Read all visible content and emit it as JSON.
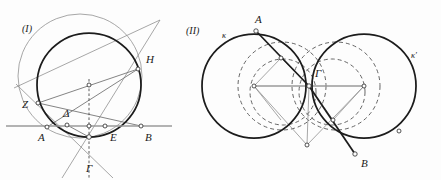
{
  "figure": {
    "background_color": "#fdfdfd",
    "ink_color": "#1c1c1c",
    "width": 441,
    "height": 180
  },
  "panels": [
    {
      "id": "panel-1",
      "label": "(I)",
      "label_x": 22,
      "label_y": 32,
      "description": "Circle with chord AB, secant lines through points Z, Delta, E, H and Gamma",
      "point_labels": [
        {
          "name": "Z",
          "text": "Z",
          "x": 22,
          "y": 108
        },
        {
          "name": "Delta",
          "text": "Δ",
          "x": 63,
          "y": 117
        },
        {
          "name": "A",
          "text": "A",
          "x": 38,
          "y": 141
        },
        {
          "name": "E",
          "text": "E",
          "x": 110,
          "y": 141
        },
        {
          "name": "B",
          "text": "B",
          "x": 145,
          "y": 141
        },
        {
          "name": "H",
          "text": "H",
          "x": 146,
          "y": 63
        },
        {
          "name": "Gamma",
          "text": "Γ",
          "x": 86,
          "y": 172
        }
      ]
    },
    {
      "id": "panel-2",
      "label": "(II)",
      "label_x": 186,
      "label_y": 34,
      "description": "Two equal intersecting circles kappa and kappa-prime with inscribed dashed circles and segments A-Gamma-B",
      "point_labels": [
        {
          "name": "A",
          "text": "A",
          "x": 255,
          "y": 23
        },
        {
          "name": "Gamma",
          "text": "Γ",
          "x": 315,
          "y": 77
        },
        {
          "name": "B",
          "text": "B",
          "x": 361,
          "y": 167
        },
        {
          "name": "kappa",
          "text": "κ",
          "x": 222,
          "y": 38
        },
        {
          "name": "kappa-prime",
          "text": "κ′",
          "x": 411,
          "y": 58
        }
      ]
    }
  ],
  "geometry": {
    "panel1": {
      "main_circle": {
        "cx": 89,
        "cy": 85,
        "r": 52
      },
      "thin_circle": {
        "cx": 80,
        "cy": 76,
        "r": 62
      },
      "horizontal_line": {
        "x1": 6,
        "y1": 126,
        "x2": 172,
        "y2": 126
      },
      "vertical_dashed": {
        "x1": 89,
        "y1": 79,
        "x2": 89,
        "y2": 178
      },
      "center_dot": {
        "cx": 89,
        "cy": 85
      },
      "nodes": [
        {
          "name": "Z",
          "cx": 38,
          "cy": 103
        },
        {
          "name": "Delta",
          "cx": 67,
          "cy": 125
        },
        {
          "name": "A",
          "cx": 47,
          "cy": 127
        },
        {
          "name": "E",
          "cx": 105,
          "cy": 126
        },
        {
          "name": "B",
          "cx": 141,
          "cy": 126
        },
        {
          "name": "H",
          "cx": 138,
          "cy": 69
        },
        {
          "name": "Gamma",
          "cx": 89,
          "cy": 137
        }
      ]
    },
    "panel2": {
      "circle_kappa": {
        "cx": 254,
        "cy": 86,
        "r": 52
      },
      "circle_kappa_prime": {
        "cx": 364,
        "cy": 86,
        "r": 52
      },
      "dashed_circle_left": {
        "cx": 282,
        "cy": 86,
        "r": 44
      },
      "dashed_circle_right": {
        "cx": 336,
        "cy": 86,
        "r": 44
      },
      "dashed_small_left": {
        "cx": 283,
        "cy": 92,
        "r": 33
      },
      "dashed_small_right": {
        "cx": 332,
        "cy": 92,
        "r": 33
      },
      "gamma_point": {
        "cx": 309,
        "cy": 86
      },
      "nodes": [
        {
          "name": "A",
          "cx": 256,
          "cy": 31
        },
        {
          "name": "B",
          "cx": 355,
          "cy": 154
        },
        {
          "name": "center-l",
          "cx": 254,
          "cy": 86
        },
        {
          "name": "center-r",
          "cx": 364,
          "cy": 86
        },
        {
          "name": "mid-upper",
          "cx": 281,
          "cy": 58
        },
        {
          "name": "mid-lower",
          "cx": 333,
          "cy": 120
        },
        {
          "name": "bottom",
          "cx": 307,
          "cy": 145
        },
        {
          "name": "arc-right",
          "cx": 399,
          "cy": 131
        }
      ],
      "horizontal_diameter": {
        "x1": 254,
        "y1": 86,
        "x2": 364,
        "y2": 86
      }
    }
  }
}
